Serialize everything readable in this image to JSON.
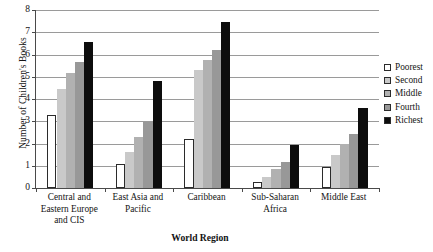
{
  "chart_data": {
    "type": "bar",
    "title": "",
    "xlabel": "World Region",
    "ylabel": "Number of Children's Books",
    "ylim": [
      0,
      8
    ],
    "yticks": [
      0,
      1,
      2,
      3,
      4,
      5,
      6,
      7,
      8
    ],
    "ytick_labels": [
      "0",
      "1",
      "2",
      "3",
      "4",
      "5",
      "6",
      "7",
      "8"
    ],
    "grid": true,
    "legend_position": "right",
    "categories": [
      "Central and Eastern Europe and CIS",
      "East Asia and Pacific",
      "Caribbean",
      "Sub-Saharan Africa",
      "Middle East"
    ],
    "category_lines": [
      [
        "Central and",
        "Eastern Europe",
        "and CIS"
      ],
      [
        "East Asia and",
        "Pacific"
      ],
      [
        "Caribbean"
      ],
      [
        "Sub-Saharan",
        "Africa"
      ],
      [
        "Middle East"
      ]
    ],
    "series": [
      {
        "name": "Poorest",
        "color": "#ffffff",
        "edge": "#2b2b2b",
        "values": [
          3.3,
          1.1,
          2.2,
          0.25,
          0.95
        ]
      },
      {
        "name": "Second",
        "color": "#c9c9c9",
        "edge": "#c9c9c9",
        "values": [
          4.45,
          1.6,
          5.3,
          0.5,
          1.5
        ]
      },
      {
        "name": "Middle",
        "color": "#b1b1b1",
        "edge": "#b1b1b1",
        "values": [
          5.15,
          2.3,
          5.75,
          0.85,
          2.0
        ]
      },
      {
        "name": "Fourth",
        "color": "#989898",
        "edge": "#989898",
        "values": [
          5.65,
          2.95,
          6.2,
          1.15,
          2.45
        ]
      },
      {
        "name": "Richest",
        "color": "#0d0d0d",
        "edge": "#0d0d0d",
        "values": [
          6.55,
          4.8,
          7.45,
          1.95,
          3.6
        ]
      }
    ]
  },
  "legend": {
    "items": [
      {
        "label": "Poorest"
      },
      {
        "label": "Second"
      },
      {
        "label": "Middle"
      },
      {
        "label": "Fourth"
      },
      {
        "label": "Richest"
      }
    ]
  }
}
